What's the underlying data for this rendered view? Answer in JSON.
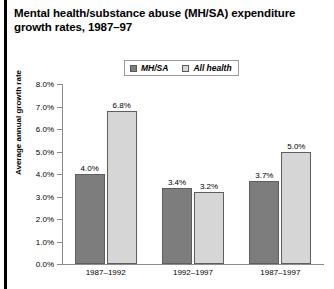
{
  "figure": {
    "title": "Mental health/substance abuse (MH/SA) expenditure growth rates, 1987–97"
  },
  "chart_data": {
    "type": "bar",
    "title": "Mental health/substance abuse (MH/SA) expenditure growth rates, 1987–97",
    "xlabel": "",
    "ylabel": "Average annual growth rate",
    "categories": [
      "1987–1992",
      "1992–1997",
      "1987–1997"
    ],
    "series": [
      {
        "name": "MH/SA",
        "color": "#7d7d7d",
        "values": [
          4.0,
          3.4,
          3.7
        ],
        "labels": [
          "4.0%",
          "3.4%",
          "3.7%"
        ]
      },
      {
        "name": "All health",
        "color": "#d6d6d6",
        "values": [
          6.8,
          3.2,
          5.0
        ],
        "labels": [
          "6.8%",
          "3.2%",
          "5.0%"
        ]
      }
    ],
    "ylim": [
      0,
      8
    ],
    "ytick_values": [
      0.0,
      1.0,
      2.0,
      3.0,
      4.0,
      5.0,
      6.0,
      7.0,
      8.0
    ],
    "ytick_labels": [
      "0.0%",
      "1.0%",
      "2.0%",
      "3.0%",
      "4.0%",
      "5.0%",
      "6.0%",
      "7.0%",
      "8.0%"
    ],
    "grid": false,
    "legend_position": "top-center"
  }
}
